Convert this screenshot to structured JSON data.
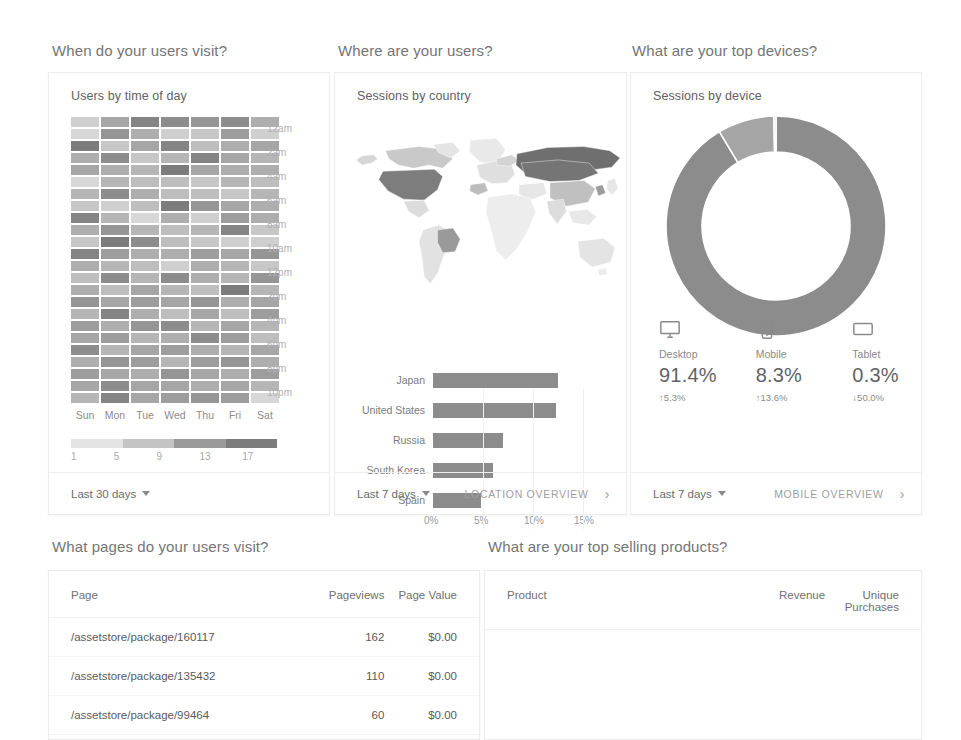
{
  "sections": {
    "when": "When do your users visit?",
    "where": "Where are your users?",
    "devices": "What are your top devices?",
    "pages": "What pages do your users visit?",
    "products": "What are your top selling products?"
  },
  "cards": {
    "time_of_day": {
      "title": "Users by time of day",
      "date_range": "Last 30 days",
      "day_labels": [
        "Sun",
        "Mon",
        "Tue",
        "Wed",
        "Thu",
        "Fri",
        "Sat"
      ],
      "hour_labels": [
        "12am",
        "2am",
        "4am",
        "6am",
        "8am",
        "10am",
        "12pm",
        "2pm",
        "4pm",
        "6pm",
        "8pm",
        "10pm"
      ],
      "legend_values": [
        "1",
        "5",
        "9",
        "13",
        "17"
      ]
    },
    "country": {
      "title": "Sessions by country",
      "date_range": "Last 7 days",
      "overview_link": "LOCATION OVERVIEW"
    },
    "device": {
      "title": "Sessions by device",
      "date_range": "Last 7 days",
      "overview_link": "MOBILE OVERVIEW",
      "stats": [
        {
          "icon": "desktop-icon",
          "name": "Desktop",
          "percent": "91.4%",
          "delta": "5.3%",
          "direction": "up"
        },
        {
          "icon": "mobile-icon",
          "name": "Mobile",
          "percent": "8.3%",
          "delta": "13.6%",
          "direction": "up"
        },
        {
          "icon": "tablet-icon",
          "name": "Tablet",
          "percent": "0.3%",
          "delta": "50.0%",
          "direction": "down"
        }
      ]
    }
  },
  "tables": {
    "pages": {
      "columns": [
        "Page",
        "Pageviews",
        "Page Value"
      ],
      "rows": [
        [
          "/assetstore/package/160117",
          "162",
          "$0.00"
        ],
        [
          "/assetstore/package/135432",
          "110",
          "$0.00"
        ],
        [
          "/assetstore/package/99464",
          "60",
          "$0.00"
        ],
        [
          "/assetstore/package/95677",
          "29",
          "$0.00"
        ]
      ]
    },
    "products": {
      "columns": [
        "Product",
        "Revenue",
        "Unique Purchases"
      ],
      "rows": []
    }
  },
  "colors": {
    "heat_min": "#e8e8e8",
    "heat_max": "#6b6b6b",
    "bar": "#8c8c8c",
    "donut_primary": "#8c8c8c",
    "donut_secondary": "#a5a5a5",
    "donut_tertiary": "#c9c9c9",
    "text": "#5f6368"
  },
  "chart_data": [
    {
      "type": "heatmap",
      "title": "Users by time of day",
      "xlabel": "",
      "ylabel": "",
      "x_categories": [
        "Sun",
        "Mon",
        "Tue",
        "Wed",
        "Thu",
        "Fri",
        "Sat"
      ],
      "y_categories": [
        "12am",
        "1am",
        "2am",
        "3am",
        "4am",
        "5am",
        "6am",
        "7am",
        "8am",
        "9am",
        "10am",
        "11am",
        "12pm",
        "1pm",
        "2pm",
        "3pm",
        "4pm",
        "5pm",
        "6pm",
        "7pm",
        "8pm",
        "9pm",
        "10pm",
        "11pm"
      ],
      "legend_ticks": [
        1,
        5,
        9,
        13,
        17
      ],
      "value_range": [
        1,
        17
      ],
      "values": [
        [
          4,
          9,
          13,
          12,
          11,
          12,
          8
        ],
        [
          3,
          11,
          8,
          4,
          5,
          10,
          4
        ],
        [
          14,
          5,
          9,
          13,
          6,
          8,
          9
        ],
        [
          8,
          12,
          5,
          7,
          13,
          9,
          7
        ],
        [
          9,
          8,
          7,
          14,
          9,
          8,
          8
        ],
        [
          3,
          7,
          6,
          6,
          5,
          7,
          6
        ],
        [
          7,
          12,
          8,
          6,
          6,
          5,
          7
        ],
        [
          5,
          4,
          6,
          14,
          11,
          9,
          8
        ],
        [
          13,
          7,
          3,
          8,
          4,
          10,
          8
        ],
        [
          8,
          11,
          7,
          6,
          7,
          13,
          5
        ],
        [
          5,
          14,
          12,
          6,
          5,
          4,
          4
        ],
        [
          13,
          10,
          8,
          8,
          10,
          9,
          11
        ],
        [
          8,
          7,
          6,
          4,
          8,
          7,
          5
        ],
        [
          6,
          12,
          7,
          12,
          8,
          7,
          11
        ],
        [
          8,
          6,
          9,
          7,
          6,
          14,
          7
        ],
        [
          11,
          9,
          10,
          9,
          11,
          8,
          9
        ],
        [
          7,
          13,
          8,
          6,
          9,
          6,
          10
        ],
        [
          10,
          8,
          11,
          12,
          7,
          9,
          7
        ],
        [
          9,
          10,
          7,
          8,
          12,
          10,
          6
        ],
        [
          12,
          7,
          9,
          10,
          8,
          7,
          9
        ],
        [
          8,
          11,
          10,
          7,
          10,
          11,
          8
        ],
        [
          10,
          9,
          8,
          11,
          9,
          8,
          10
        ],
        [
          9,
          12,
          9,
          9,
          8,
          9,
          7
        ],
        [
          7,
          13,
          9,
          10,
          11,
          10,
          3
        ]
      ]
    },
    {
      "type": "bar",
      "title": "Sessions by country",
      "orientation": "horizontal",
      "categories": [
        "Japan",
        "United States",
        "Russia",
        "South Korea",
        "Spain"
      ],
      "values": [
        12.5,
        12.3,
        7.0,
        6.0,
        4.8
      ],
      "xlabel": "",
      "ylabel": "",
      "xlim": [
        0,
        17
      ],
      "x_ticks": [
        "0%",
        "5%",
        "10%",
        "15%"
      ],
      "x_tick_values": [
        0,
        5,
        10,
        15
      ],
      "grid": true
    },
    {
      "type": "pie",
      "title": "Sessions by device",
      "subtype": "donut",
      "labels": [
        "Desktop",
        "Mobile",
        "Tablet"
      ],
      "values": [
        91.4,
        8.3,
        0.3
      ],
      "legend": "bottom"
    }
  ]
}
